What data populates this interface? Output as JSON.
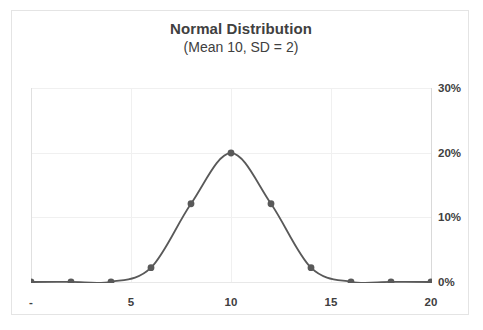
{
  "chart_data": {
    "type": "line",
    "title": "Normal Distribution",
    "subtitle": "(Mean 10, SD = 2)",
    "xlabel": "",
    "ylabel": "",
    "x": [
      0,
      2,
      4,
      6,
      8,
      10,
      12,
      14,
      16,
      18,
      20
    ],
    "values": [
      0.0,
      0.0001,
      0.0002,
      0.0221,
      0.121,
      0.1995,
      0.121,
      0.0221,
      0.0002,
      0.0001,
      0.0
    ],
    "series": [
      {
        "name": "Normal PDF",
        "values": [
          0.0,
          0.0001,
          0.0002,
          0.0221,
          0.121,
          0.1995,
          0.121,
          0.0221,
          0.0002,
          0.0001,
          0.0
        ]
      }
    ],
    "xlim": [
      0,
      20
    ],
    "ylim": [
      0,
      0.3
    ],
    "grid": true,
    "legend": false,
    "legend_position": "none",
    "y_axis_side": "right",
    "markers": true,
    "line_color": "#595959",
    "marker_color": "#595959",
    "y_tick_labels": [
      "30%",
      "20%",
      "10%",
      "0%"
    ],
    "y_tick_values": [
      0.3,
      0.2,
      0.1,
      0.0
    ],
    "x_tick_labels": [
      "-",
      "5",
      "10",
      "15",
      "20"
    ],
    "x_tick_values": [
      0,
      5,
      10,
      15,
      20
    ]
  },
  "colors": {
    "series": "#595959",
    "grid": "#f0f0f0",
    "axis": "#d9d9d9",
    "text": "#404040",
    "frame": "#e4e4e4"
  }
}
